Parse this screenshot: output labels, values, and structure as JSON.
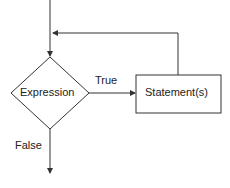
{
  "diagram": {
    "type": "flowchart-while-loop",
    "decision": {
      "label": "Expression"
    },
    "process": {
      "label": "Statement(s)"
    },
    "edges": {
      "true_label": "True",
      "false_label": "False"
    },
    "colors": {
      "stroke": "#333333",
      "text": "#222222",
      "background": "#ffffff"
    }
  }
}
